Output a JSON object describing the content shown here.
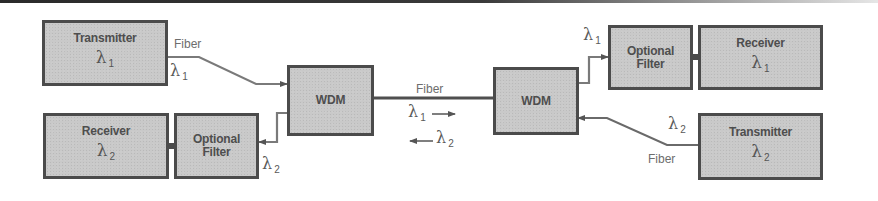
{
  "diagram": {
    "blocks": {
      "transmitter_1": {
        "title": "Transmitter",
        "lambda": "λ",
        "sub": "1"
      },
      "receiver_2": {
        "title": "Receiver",
        "lambda": "λ",
        "sub": "2"
      },
      "filter_left": {
        "title_line1": "Optional",
        "title_line2": "Filter"
      },
      "wdm_left": {
        "title": "WDM"
      },
      "wdm_right": {
        "title": "WDM"
      },
      "filter_right": {
        "title_line1": "Optional",
        "title_line2": "Filter"
      },
      "receiver_1": {
        "title": "Receiver",
        "lambda": "λ",
        "sub": "1"
      },
      "transmitter_2": {
        "title": "Transmitter",
        "lambda": "λ",
        "sub": "2"
      }
    },
    "labels": {
      "fiber_tx1": "Fiber",
      "lambda_tx1": {
        "sym": "λ",
        "sub": "1"
      },
      "lambda_rx2": {
        "sym": "λ",
        "sub": "2"
      },
      "fiber_center": "Fiber",
      "lambda_forward": {
        "sym": "λ",
        "sub": "1",
        "arrow": "⟶"
      },
      "lambda_backward": {
        "sym": "λ",
        "sub": "2",
        "arrow": "⟵"
      },
      "lambda_rx1": {
        "sym": "λ",
        "sub": "1"
      },
      "lambda_tx2": {
        "sym": "λ",
        "sub": "2"
      },
      "fiber_tx2": "Fiber"
    },
    "colors": {
      "box_fill": "#c9c9c9",
      "box_border": "#4b4b4b",
      "text": "#4e4e4e",
      "wire": "#6a6a6a"
    }
  }
}
